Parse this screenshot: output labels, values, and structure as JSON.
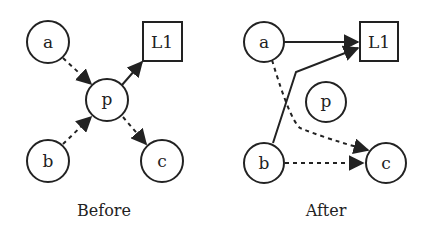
{
  "panels": [
    {
      "caption": "Before",
      "nodes": {
        "a": "a",
        "b": "b",
        "c": "c",
        "p": "p",
        "L1": "L1"
      },
      "edges": [
        {
          "from": "a",
          "to": "p",
          "style": "dashed"
        },
        {
          "from": "b",
          "to": "p",
          "style": "dashed"
        },
        {
          "from": "p",
          "to": "c",
          "style": "dashed"
        },
        {
          "from": "p",
          "to": "L1",
          "style": "solid"
        }
      ]
    },
    {
      "caption": "After",
      "nodes": {
        "a": "a",
        "b": "b",
        "c": "c",
        "p": "p",
        "L1": "L1"
      },
      "edges": [
        {
          "from": "a",
          "to": "L1",
          "style": "solid"
        },
        {
          "from": "b",
          "to": "L1",
          "style": "solid"
        },
        {
          "from": "a",
          "to": "c",
          "style": "dashed"
        },
        {
          "from": "b",
          "to": "c",
          "style": "dashed"
        }
      ]
    }
  ],
  "colors": {
    "stroke": "#222222",
    "background": "#ffffff"
  }
}
